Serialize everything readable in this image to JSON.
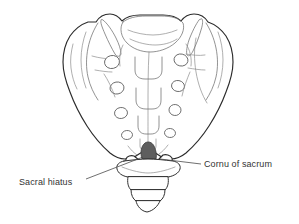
{
  "figure": {
    "background_color": "#ffffff",
    "width": 299,
    "height": 224
  },
  "labels": [
    {
      "id": "cornu-of-sacrum",
      "text": "Cornu of sacrum",
      "x": 204,
      "y": 159,
      "leader_from": [
        201,
        164
      ],
      "leader_to": [
        160,
        160
      ]
    },
    {
      "id": "sacral-hiatus",
      "text": "Sacral hiatus",
      "x": 19,
      "y": 177,
      "leader_from": [
        86,
        178
      ],
      "leader_to": [
        141,
        158
      ]
    }
  ],
  "structures": {
    "sacrum_label": "sacrum",
    "coccyx_label": "coccyx",
    "hiatus_label": "sacral hiatus",
    "cornu_label": "cornu of sacrum",
    "ala_left_label": "left ala of sacrum",
    "ala_right_label": "right ala of sacrum",
    "foramina_label": "posterior sacral foramina",
    "foramina_count": 8,
    "coccyx_segments": 4
  },
  "colors": {
    "outline": "#2b2b2b",
    "detail": "#6f6f6f",
    "hiatus_fill": "#5e5e5e",
    "text": "#333333",
    "background": "#ffffff"
  }
}
